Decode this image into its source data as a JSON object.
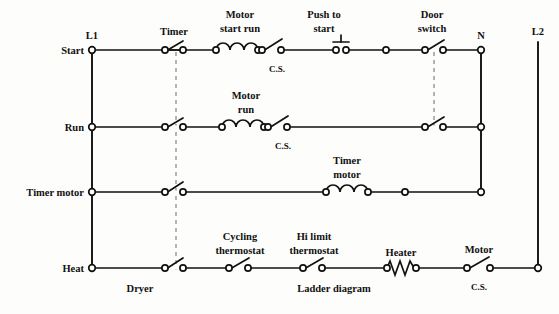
{
  "diagram": {
    "captions": [
      {
        "id": "dryer",
        "text": "Dryer",
        "x": 140,
        "y": 290
      },
      {
        "id": "ladder-diagram",
        "text": "Ladder diagram",
        "x": 332,
        "y": 290
      }
    ],
    "buses": [
      {
        "id": "l1",
        "label": "L1",
        "x": 92,
        "y_top": 50,
        "y_bottom": 268,
        "label_x": 92,
        "label_y": 38
      },
      {
        "id": "n",
        "label": "N",
        "x": 481,
        "y_top": 50,
        "y_bottom": 192,
        "label_x": 481,
        "label_y": 38
      },
      {
        "id": "l2",
        "label": "L2",
        "x": 538,
        "y_top": 42,
        "y_bottom": 268,
        "label_x": 538,
        "label_y": 36
      }
    ],
    "rungs": [
      {
        "id": "start",
        "label": "Start",
        "y": 50,
        "label_x": 78,
        "right_bus": "n"
      },
      {
        "id": "run",
        "label": "Run",
        "y": 127,
        "label_x": 78,
        "right_bus": "n"
      },
      {
        "id": "timer-motor",
        "label": "Timer motor",
        "y": 192,
        "label_x": 78,
        "right_bus": "n"
      },
      {
        "id": "heat",
        "label": "Heat",
        "y": 268,
        "label_x": 78,
        "right_bus": "l2"
      }
    ],
    "linkages": [
      {
        "id": "timer-linkage",
        "x": 176,
        "y_top": 52,
        "y_bottom": 270,
        "style": "dashed"
      },
      {
        "id": "door-switch-linkage",
        "x": 434,
        "y_top": 52,
        "y_bottom": 129,
        "style": "dashed"
      }
    ],
    "components": [
      {
        "id": "timer-switch-start",
        "type": "switch",
        "rung": "start",
        "label": "Timer",
        "label_x": 174,
        "label_y": 34,
        "sublabel": "",
        "x1": 165,
        "x2": 183
      },
      {
        "id": "motor-start-run-coil",
        "type": "coil",
        "rung": "start",
        "label": "Motor\nstart run",
        "label_lines": [
          "Motor",
          "start run"
        ],
        "label_x": 240,
        "label_y": 20,
        "x1": 216,
        "x2": 258
      },
      {
        "id": "motor-start-run-cs",
        "type": "switch",
        "rung": "start",
        "label": "",
        "sublabel": "C.S.",
        "sublabel_x": 278,
        "sublabel_y": 72,
        "x1": 262,
        "x2": 281
      },
      {
        "id": "push-to-start-button",
        "type": "pushbutton",
        "rung": "start",
        "label_lines": [
          "Push to",
          "start"
        ],
        "label_x": 330,
        "label_y": 20,
        "x1": 336,
        "x2": 346
      },
      {
        "id": "start-node-mid",
        "type": "node",
        "rung": "start",
        "x1": 386
      },
      {
        "id": "door-switch-start",
        "type": "switch",
        "rung": "start",
        "label_lines": [
          "Door",
          "switch"
        ],
        "label_x": 432,
        "label_y": 20,
        "x1": 425,
        "x2": 443
      },
      {
        "id": "timer-switch-run",
        "type": "switch",
        "rung": "run",
        "x1": 165,
        "x2": 183
      },
      {
        "id": "motor-run-coil",
        "type": "coil",
        "rung": "run",
        "label_lines": [
          "Motor",
          "run"
        ],
        "label_x": 246,
        "label_y": 97,
        "x1": 222,
        "x2": 264
      },
      {
        "id": "motor-run-cs",
        "type": "switch",
        "rung": "run",
        "sublabel": "C.S.",
        "sublabel_x": 284,
        "sublabel_y": 149,
        "x1": 268,
        "x2": 287
      },
      {
        "id": "door-switch-run",
        "type": "switch",
        "rung": "run",
        "x1": 425,
        "x2": 443
      },
      {
        "id": "timer-switch-timermotor",
        "type": "switch",
        "rung": "timer-motor",
        "x1": 165,
        "x2": 183
      },
      {
        "id": "timer-motor-coil",
        "type": "coil",
        "rung": "timer-motor",
        "label_lines": [
          "Timer",
          "motor"
        ],
        "label_x": 347,
        "label_y": 162,
        "x1": 326,
        "x2": 368
      },
      {
        "id": "timer-motor-node-mid",
        "type": "node",
        "rung": "timer-motor",
        "x1": 405
      },
      {
        "id": "timer-switch-heat",
        "type": "switch",
        "rung": "heat",
        "x1": 165,
        "x2": 183
      },
      {
        "id": "cycling-thermostat",
        "type": "switch",
        "rung": "heat",
        "label_lines": [
          "Cycling",
          "thermostat"
        ],
        "label_x": 240,
        "label_y": 238,
        "x1": 229,
        "x2": 248
      },
      {
        "id": "hi-limit-thermostat",
        "type": "switch",
        "rung": "heat",
        "label_lines": [
          "Hi limit",
          "thermostat"
        ],
        "label_x": 314,
        "label_y": 238,
        "x1": 303,
        "x2": 322
      },
      {
        "id": "heater-element",
        "type": "resistor",
        "rung": "heat",
        "label": "Heater",
        "label_x": 401,
        "label_y": 257,
        "x1": 387,
        "x2": 416
      },
      {
        "id": "motor-cs-heat",
        "type": "switch",
        "rung": "heat",
        "label": "Motor",
        "label_x": 478,
        "label_y": 253,
        "sublabel": "C.S.",
        "sublabel_x": 479,
        "sublabel_y": 290,
        "x1": 467,
        "x2": 490
      }
    ]
  },
  "colors": {
    "wire": "#111111",
    "dashed_linkage": "#9a9a9a",
    "background": "#fdfdfb"
  }
}
